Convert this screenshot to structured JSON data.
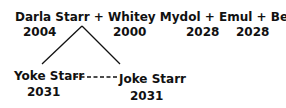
{
  "family": {
    "parents_line": "Darla Starr + Whitey Mydol + Emul + Berenice",
    "members": [
      {
        "name": "Darla Starr",
        "year": "2004"
      },
      {
        "name": "Whitey Mydol",
        "year": "2000"
      },
      {
        "name": "Emul",
        "year": "2028"
      },
      {
        "name": "Berenice",
        "year": "2028"
      }
    ],
    "children": [
      {
        "name": "Yoke Starr",
        "year": "2031"
      },
      {
        "name": "Joke Starr",
        "year": "2031"
      }
    ],
    "sibling_connector": "dashed"
  }
}
